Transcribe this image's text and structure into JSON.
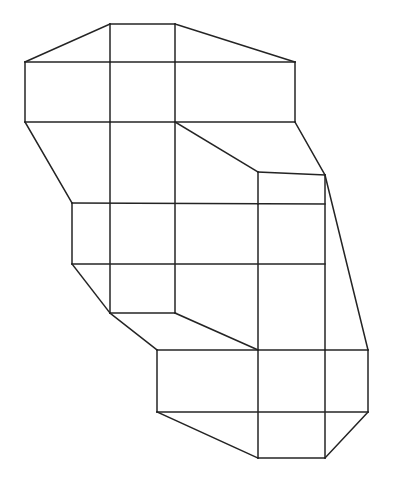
{
  "document": {
    "title": "Polycube Line Drawing",
    "kind": "geometric-line-figure",
    "description": "Axonometric outline drawing of a stacked cube (polycube) structure composed of straight black line segments on a white background",
    "canvas": {
      "width": 393,
      "height": 492,
      "background_color": "#ffffff"
    },
    "style": {
      "stroke_color": "#242424",
      "stroke_width": 1.5,
      "fill": "none"
    }
  },
  "figure": {
    "name": "stacked-cubes-outline",
    "vertex_count": 32,
    "segment_count": 36,
    "segments": [
      {
        "name": "top-apex-left-ridge",
        "x1": 110,
        "y1": 24,
        "x2": 25,
        "y2": 62
      },
      {
        "name": "top-edge-upper",
        "x1": 110,
        "y1": 24,
        "x2": 175,
        "y2": 24
      },
      {
        "name": "top-apex-right-ridge",
        "x1": 175,
        "y1": 24,
        "x2": 295,
        "y2": 62
      },
      {
        "name": "top-face-divider-left",
        "x1": 110,
        "y1": 24,
        "x2": 110,
        "y2": 62
      },
      {
        "name": "top-face-divider-right",
        "x1": 175,
        "y1": 24,
        "x2": 175,
        "y2": 62
      },
      {
        "name": "upper-band-top-rail",
        "x1": 25,
        "y1": 62,
        "x2": 295,
        "y2": 62
      },
      {
        "name": "upper-band-left-post",
        "x1": 25,
        "y1": 62,
        "x2": 25,
        "y2": 122
      },
      {
        "name": "upper-band-right-post",
        "x1": 295,
        "y1": 62,
        "x2": 295,
        "y2": 122
      },
      {
        "name": "upper-band-bottom-rail",
        "x1": 25,
        "y1": 122,
        "x2": 295,
        "y2": 122
      },
      {
        "name": "column-a-upper",
        "x1": 110,
        "y1": 62,
        "x2": 110,
        "y2": 122
      },
      {
        "name": "column-b-upper",
        "x1": 175,
        "y1": 62,
        "x2": 175,
        "y2": 122
      },
      {
        "name": "left-outer-slope-upper",
        "x1": 25,
        "y1": 122,
        "x2": 72,
        "y2": 203
      },
      {
        "name": "inner-step-diagonal",
        "x1": 175,
        "y1": 122,
        "x2": 258,
        "y2": 172
      },
      {
        "name": "right-outer-slope-upper",
        "x1": 295,
        "y1": 122,
        "x2": 325,
        "y2": 175
      },
      {
        "name": "notch-top-rail",
        "x1": 258,
        "y1": 172,
        "x2": 325,
        "y2": 175
      },
      {
        "name": "notch-left-post",
        "x1": 258,
        "y1": 172,
        "x2": 258,
        "y2": 204
      },
      {
        "name": "middle-band-top-rail",
        "x1": 72,
        "y1": 203,
        "x2": 325,
        "y2": 204
      },
      {
        "name": "middle-band-left-post",
        "x1": 72,
        "y1": 203,
        "x2": 72,
        "y2": 264
      },
      {
        "name": "middle-band-bottom-rail",
        "x1": 72,
        "y1": 264,
        "x2": 325,
        "y2": 264
      },
      {
        "name": "column-a-middle",
        "x1": 110,
        "y1": 122,
        "x2": 110,
        "y2": 313
      },
      {
        "name": "column-b-middle",
        "x1": 175,
        "y1": 122,
        "x2": 175,
        "y2": 313
      },
      {
        "name": "column-c-middle",
        "x1": 258,
        "y1": 204,
        "x2": 258,
        "y2": 350
      },
      {
        "name": "right-outer-slope-lower",
        "x1": 325,
        "y1": 175,
        "x2": 368,
        "y2": 350
      },
      {
        "name": "column-d-middle",
        "x1": 325,
        "y1": 175,
        "x2": 325,
        "y2": 350
      },
      {
        "name": "left-outer-slope-lower",
        "x1": 72,
        "y1": 264,
        "x2": 110,
        "y2": 313
      },
      {
        "name": "low-step-bottom-rail",
        "x1": 110,
        "y1": 313,
        "x2": 175,
        "y2": 313
      },
      {
        "name": "low-step-diagonal",
        "x1": 175,
        "y1": 313,
        "x2": 258,
        "y2": 350
      },
      {
        "name": "left-lower-slope",
        "x1": 110,
        "y1": 313,
        "x2": 157,
        "y2": 350
      },
      {
        "name": "bottom-band-top-rail",
        "x1": 157,
        "y1": 350,
        "x2": 368,
        "y2": 350
      },
      {
        "name": "bottom-band-left-post",
        "x1": 157,
        "y1": 350,
        "x2": 157,
        "y2": 412
      },
      {
        "name": "bottom-band-right-post",
        "x1": 368,
        "y1": 350,
        "x2": 368,
        "y2": 412
      },
      {
        "name": "bottom-band-bottom-rail",
        "x1": 157,
        "y1": 412,
        "x2": 368,
        "y2": 412
      },
      {
        "name": "column-c-lower",
        "x1": 258,
        "y1": 350,
        "x2": 258,
        "y2": 458
      },
      {
        "name": "column-d-lower",
        "x1": 325,
        "y1": 350,
        "x2": 325,
        "y2": 458
      },
      {
        "name": "bottom-left-slope",
        "x1": 157,
        "y1": 412,
        "x2": 258,
        "y2": 458
      },
      {
        "name": "bottom-face-rail",
        "x1": 258,
        "y1": 458,
        "x2": 325,
        "y2": 458
      },
      {
        "name": "bottom-right-slope",
        "x1": 325,
        "y1": 458,
        "x2": 368,
        "y2": 412
      }
    ]
  }
}
